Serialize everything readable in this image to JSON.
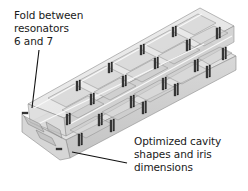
{
  "figure": {
    "type": "isometric 3D model of folded waveguide resonator filter",
    "annotations": [
      {
        "id": "fold",
        "lines": [
          "Fold between",
          "resonators",
          "6 and 7"
        ]
      },
      {
        "id": "cavity",
        "lines": [
          "Optimized cavity",
          "shapes and iris",
          "dimensions"
        ]
      }
    ],
    "colors": {
      "background": "#ffffff",
      "body_light": "#ececec",
      "body_mid": "#d4d4d4",
      "body_dark": "#b8b8b8",
      "edge": "#8a8a8a",
      "iris": "#3a3a3a",
      "leader": "#111111",
      "text": "#1a1a1a"
    }
  }
}
